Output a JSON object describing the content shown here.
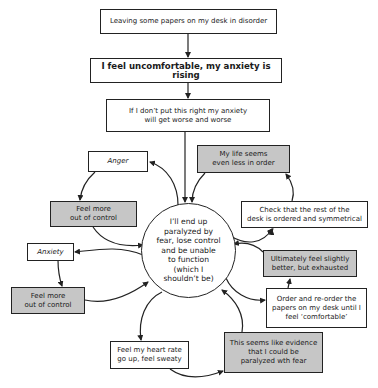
{
  "diagram": {
    "type": "flowchart",
    "theme": {
      "line_color": "#222222",
      "box_fill": "#ffffff",
      "highlight_fill": "#c6c6c6"
    },
    "nodes": {
      "trigger": {
        "label": "Leaving some papers on my desk in disorder"
      },
      "feeling": {
        "label": "I feel uncomfortable, my anxiety is rising"
      },
      "thought": {
        "label": "If I don’t put this right my anxiety\nwill get worse and worse"
      },
      "center": {
        "label": "I’ll end up\nparalyzed by\nfear, lose control\nand be unable\nto function\n(which I\nshouldn’t be)"
      },
      "anger": {
        "label": "Anger"
      },
      "out_of_control_1": {
        "label": "Feel more\nout of control"
      },
      "anxiety": {
        "label": "Anxiety"
      },
      "out_of_control_2": {
        "label": "Feel more\nout of control"
      },
      "heart_rate": {
        "label": "Feel my heart rate\ngo up, feel sweaty"
      },
      "evidence": {
        "label": "This seems like evidence\nthat I could be\nparalyzed wth fear"
      },
      "my_life": {
        "label": "My life seems\neven less in order"
      },
      "check_desk": {
        "label": "Check that the rest of the\ndesk is ordered and symmetrical"
      },
      "ultimately": {
        "label": "Ultimately feel slightly\nbetter, but exhausted"
      },
      "reorder": {
        "label": "Order and re-order the\npapers on my desk until I\nfeel ‘comfortable’"
      }
    },
    "edges": [
      {
        "from": "trigger",
        "to": "feeling"
      },
      {
        "from": "feeling",
        "to": "thought"
      },
      {
        "from": "thought",
        "to": "center"
      },
      {
        "from": "center",
        "to": "anger"
      },
      {
        "from": "anger",
        "to": "out_of_control_1"
      },
      {
        "from": "out_of_control_1",
        "to": "center"
      },
      {
        "from": "center",
        "to": "anxiety"
      },
      {
        "from": "anxiety",
        "to": "out_of_control_2"
      },
      {
        "from": "out_of_control_2",
        "to": "center"
      },
      {
        "from": "center",
        "to": "heart_rate"
      },
      {
        "from": "heart_rate",
        "to": "evidence"
      },
      {
        "from": "evidence",
        "to": "center"
      },
      {
        "from": "center",
        "to": "check_desk"
      },
      {
        "from": "check_desk",
        "to": "my_life"
      },
      {
        "from": "my_life",
        "to": "center"
      },
      {
        "from": "center",
        "to": "reorder"
      },
      {
        "from": "reorder",
        "to": "ultimately"
      },
      {
        "from": "ultimately",
        "to": "center"
      }
    ]
  }
}
